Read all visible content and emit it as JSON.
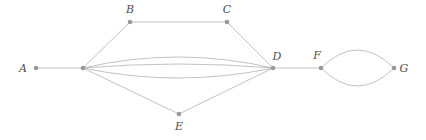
{
  "figure": {
    "kind": "graph-diagram",
    "title": "",
    "width": 426,
    "height": 140,
    "background_color": "#ffffff"
  },
  "style": {
    "edge_color": "#b3b3b3",
    "edge_width": 0.8,
    "node_color": "#999999",
    "node_radius": 2.3,
    "label_color": "#4d4d4d",
    "label_font_size": 11
  },
  "graph": {
    "type": "undirected-multigraph",
    "node_count": 8,
    "edge_count": 11,
    "nodes": [
      {
        "id": "A",
        "label": "A",
        "x": 36,
        "y": 68,
        "labeled": true,
        "label_x": 23,
        "label_y": 72
      },
      {
        "id": "HUB",
        "label": "",
        "x": 83,
        "y": 68,
        "labeled": false,
        "label_x": 83,
        "label_y": 68
      },
      {
        "id": "B",
        "label": "B",
        "x": 130,
        "y": 22,
        "labeled": true,
        "label_x": 130,
        "label_y": 13
      },
      {
        "id": "C",
        "label": "C",
        "x": 227,
        "y": 22,
        "labeled": true,
        "label_x": 227,
        "label_y": 13
      },
      {
        "id": "D",
        "label": "D",
        "x": 273,
        "y": 68,
        "labeled": true,
        "label_x": 277,
        "label_y": 60
      },
      {
        "id": "E",
        "label": "E",
        "x": 179,
        "y": 114,
        "labeled": true,
        "label_x": 179,
        "label_y": 130
      },
      {
        "id": "F",
        "label": "F",
        "x": 321,
        "y": 68,
        "labeled": true,
        "label_x": 317,
        "label_y": 59
      },
      {
        "id": "G",
        "label": "G",
        "x": 394,
        "y": 68,
        "labeled": true,
        "label_x": 404,
        "label_y": 72
      }
    ],
    "edges": [
      {
        "id": "e-a-hub",
        "from": "A",
        "to": "HUB",
        "shape": "straight",
        "curvature": 0
      },
      {
        "id": "e-hub-b",
        "from": "HUB",
        "to": "B",
        "shape": "straight",
        "curvature": 0
      },
      {
        "id": "e-b-c",
        "from": "B",
        "to": "C",
        "shape": "straight",
        "curvature": 0
      },
      {
        "id": "e-c-d",
        "from": "C",
        "to": "D",
        "shape": "straight",
        "curvature": 0
      },
      {
        "id": "e-hub-d-1",
        "from": "HUB",
        "to": "D",
        "shape": "arc-up",
        "curvature": -11
      },
      {
        "id": "e-hub-d-2",
        "from": "HUB",
        "to": "D",
        "shape": "arc-up",
        "curvature": -4
      },
      {
        "id": "e-hub-d-3",
        "from": "HUB",
        "to": "D",
        "shape": "arc-down",
        "curvature": 10
      },
      {
        "id": "e-hub-e",
        "from": "HUB",
        "to": "E",
        "shape": "straight",
        "curvature": 0
      },
      {
        "id": "e-e-d",
        "from": "E",
        "to": "D",
        "shape": "straight",
        "curvature": 0
      },
      {
        "id": "e-d-f",
        "from": "D",
        "to": "F",
        "shape": "straight",
        "curvature": 0
      },
      {
        "id": "e-f-g-1",
        "from": "F",
        "to": "G",
        "shape": "arc-up",
        "curvature": -18
      },
      {
        "id": "e-f-g-2",
        "from": "F",
        "to": "G",
        "shape": "arc-down",
        "curvature": 18
      }
    ]
  }
}
